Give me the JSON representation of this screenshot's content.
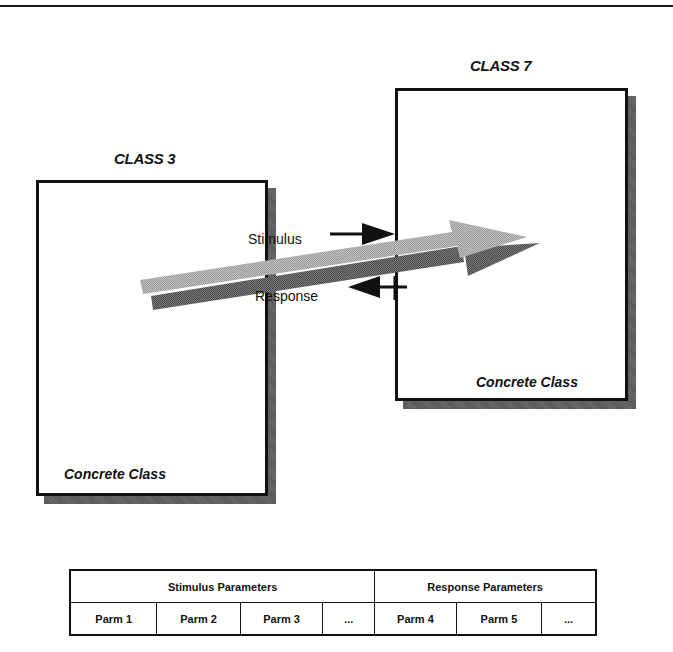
{
  "diagram": {
    "class_left": {
      "title": "CLASS 3",
      "label": "Concrete Class"
    },
    "class_right": {
      "title": "CLASS 7",
      "label": "Concrete Class"
    },
    "messages": {
      "stimulus": "Stimulus",
      "response": "Response"
    },
    "colors": {
      "box_border": "#111111",
      "shadow": "#6a6a6a",
      "arrow_light": "#b4b4b4",
      "arrow_dark": "#6e6e6e"
    }
  },
  "parameters_table": {
    "groups": [
      {
        "label": "Stimulus Parameters",
        "span": 4
      },
      {
        "label": "Response Parameters",
        "span": 3
      }
    ],
    "cells": [
      "Parm 1",
      "Parm 2",
      "Parm 3",
      "...",
      "Parm 4",
      "Parm 5",
      "..."
    ]
  }
}
